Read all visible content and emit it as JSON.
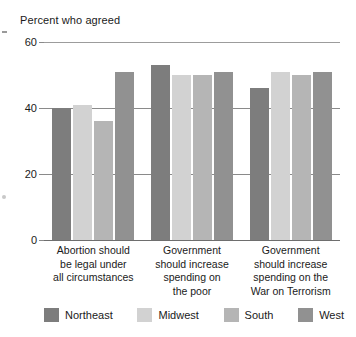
{
  "chart_data": {
    "type": "bar",
    "title": "Percent who agreed",
    "xlabel": "",
    "ylabel": "",
    "ylim": [
      0,
      60
    ],
    "yticks": [
      0,
      20,
      40,
      60
    ],
    "grid": true,
    "legend_position": "bottom",
    "categories": [
      "Abortion should be legal under all circumstances",
      "Government should increase spending on the poor",
      "Government should increase spending on the War on Terrorism"
    ],
    "category_lines": [
      [
        "Abortion should",
        "be legal under",
        "all circumstances"
      ],
      [
        "Government",
        "should increase",
        "spending on",
        "the poor"
      ],
      [
        "Government",
        "should increase",
        "spending on the",
        "War on Terrorism"
      ]
    ],
    "series": [
      {
        "name": "Northeast",
        "color": "#7d7d7d",
        "values": [
          40,
          53,
          46
        ]
      },
      {
        "name": "Midwest",
        "color": "#d2d2d2",
        "values": [
          41,
          50,
          51
        ]
      },
      {
        "name": "South",
        "color": "#b5b5b5",
        "values": [
          36,
          50,
          50
        ]
      },
      {
        "name": "West",
        "color": "#919191",
        "values": [
          51,
          51,
          51
        ]
      }
    ]
  }
}
